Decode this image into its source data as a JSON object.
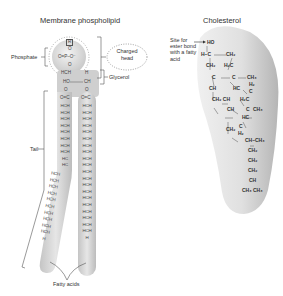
{
  "phospholipid": {
    "title": "Membrane phospholipid",
    "labels": {
      "phosphate": "Phosphate",
      "charged_head": "Charged head",
      "charged_head_line1": "Charged",
      "charged_head_line2": "head",
      "glycerol": "Glycerol",
      "tail": "Tail",
      "fatty_acids": "Fatty acids"
    },
    "head_groups": {
      "top": "R",
      "phosphate_row": "O=P–O⁻",
      "o1": "O",
      "o2": "O",
      "glycerol_left_1": "HCH",
      "glycerol_left_2": "HO",
      "glycerol_right_1": "H",
      "glycerol_right_2": "CH",
      "ester_o_left": "O",
      "ester_o_right": "O",
      "carbonyl_left": "O=C",
      "carbonyl_right": "O=C"
    },
    "left_chain": [
      "HCH",
      "HCH",
      "HCH",
      "HCH",
      "HCH",
      "HCH",
      "HCH",
      "HCH",
      "HC",
      "HC",
      "HCH",
      "HCH",
      "HCH",
      "HCH",
      "HCH",
      "HCH",
      "HCH",
      "HCH",
      "HCH",
      "HCH",
      "H"
    ],
    "right_chain": [
      "HCH",
      "HCH",
      "HCH",
      "HCH",
      "HCH",
      "HCH",
      "HCH",
      "HCH",
      "HCH",
      "HCH",
      "HCH",
      "HCH",
      "HCH",
      "HCH",
      "HCH",
      "HCH",
      "HCH",
      "HCH",
      "HCH",
      "HCH",
      "H"
    ]
  },
  "cholesterol": {
    "title": "Cholesterol",
    "annotation_line1": "Site for",
    "annotation_line2": "ester bond",
    "annotation_line3": "with a fatty",
    "annotation_line4": "acid",
    "groups": {
      "ho": "HO",
      "h_c": "H–C",
      "ch2_a": "CH₂",
      "ch2_b": "CH₂",
      "h2c_a": "H₂C",
      "c_a": "C",
      "c_b": "C",
      "ch3_a": "CH₃",
      "ch_a": "CH",
      "hc_a": "HC",
      "h2_a": "H₂",
      "c_c": "C",
      "ch2_ch": "CH₂ CH",
      "h2c_b": "H₂C",
      "ch_b": "CH",
      "c_d": "C",
      "ch3_b": "CH₃",
      "hc_b": "HC",
      "ch2_c": "CH₂",
      "c_e": "C",
      "h2_b": "H₂",
      "ch_ch3": "CH–CH₃",
      "ch2_d": "CH₂",
      "ch2_e": "CH₂",
      "ch2_f": "CH₂",
      "ch_c": "CH",
      "ch3_ch3": "CH₃ CH₃"
    }
  }
}
